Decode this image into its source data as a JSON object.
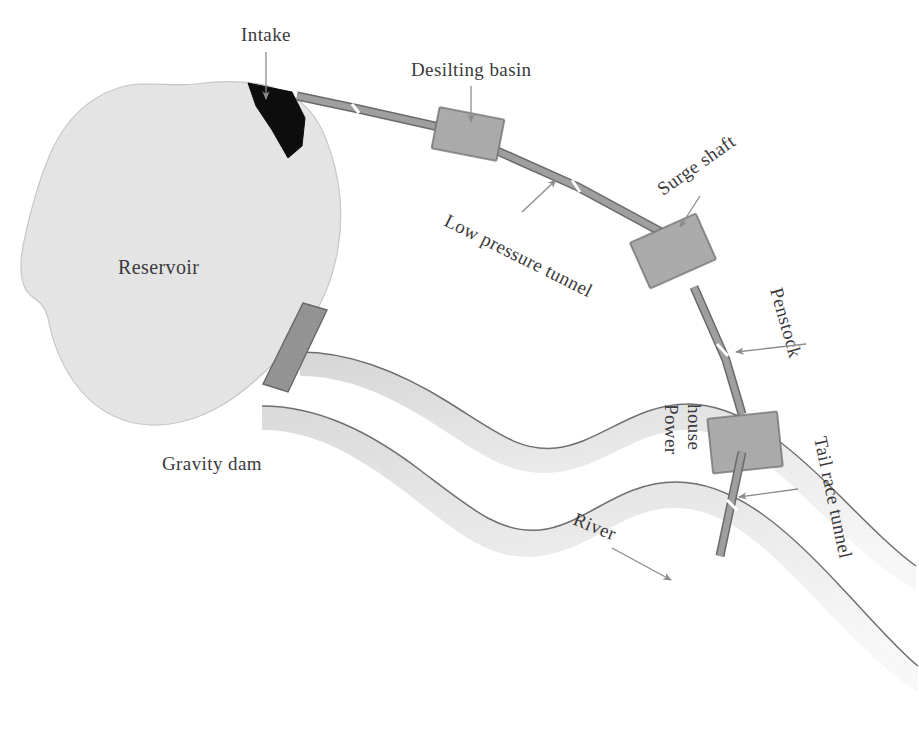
{
  "diagram": {
    "type": "engineering-schematic",
    "background_color": "#ffffff"
  },
  "labels": {
    "intake": "Intake",
    "desilting_basin": "Desilting basin",
    "low_pressure_tunnel": "Low pressure tunnel",
    "surge_shaft": "Surge shaft",
    "penstock": "Penstock",
    "power_house_line1": "Power",
    "power_house_line2": "house",
    "tail_race_tunnel": "Tail race tunnel",
    "reservoir": "Reservoir",
    "gravity_dam": "Gravity dam",
    "river": "River"
  },
  "colors": {
    "reservoir_fill": "#e7e7e7",
    "reservoir_stroke": "#c9c9c9",
    "intake_fill": "#0d0d0d",
    "structure_fill": "#a9a9a9",
    "structure_stroke": "#6e6e6e",
    "tunnel_fill": "#9c9c9c",
    "tunnel_stroke": "#6a6a6a",
    "dam_fill": "#8f8f8f",
    "dam_stroke": "#5f5f5f",
    "river_fill": "#ededed",
    "river_stroke": "#7b7b7b",
    "label_text": "#3b3a3c",
    "arrow": "#8c8c8c"
  },
  "components": [
    {
      "name": "reservoir",
      "kind": "water-body"
    },
    {
      "name": "gravity-dam",
      "kind": "structure"
    },
    {
      "name": "intake",
      "kind": "structure"
    },
    {
      "name": "desilting-basin",
      "kind": "structure"
    },
    {
      "name": "low-pressure-tunnel",
      "kind": "conduit"
    },
    {
      "name": "surge-shaft",
      "kind": "structure"
    },
    {
      "name": "penstock",
      "kind": "conduit"
    },
    {
      "name": "power-house",
      "kind": "structure"
    },
    {
      "name": "tail-race-tunnel",
      "kind": "conduit"
    },
    {
      "name": "river",
      "kind": "water-body"
    }
  ]
}
